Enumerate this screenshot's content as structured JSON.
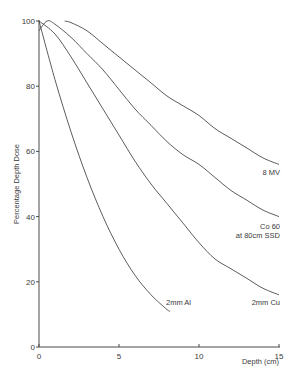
{
  "chart_data": {
    "type": "line",
    "title": "",
    "xlabel": "Depth (cm)",
    "ylabel": "Percentage Depth Dose",
    "xlim": [
      0,
      15
    ],
    "ylim": [
      0,
      100
    ],
    "x_ticks": [
      0,
      5,
      10,
      15
    ],
    "x_tick_labels": [
      "0",
      "5",
      "10",
      "15"
    ],
    "y_ticks": [
      0,
      20,
      40,
      60,
      80,
      100
    ],
    "y_tick_labels": [
      "0",
      "20",
      "40",
      "60",
      "80",
      "100"
    ],
    "grid": false,
    "legend": "inline labels at curve ends",
    "series": [
      {
        "name": "8 MV",
        "label_lines": [
          "8 MV"
        ],
        "x": [
          1.6,
          2,
          3,
          4,
          5,
          6,
          7,
          8,
          9,
          10,
          11,
          12,
          13,
          14,
          15
        ],
        "values": [
          100,
          99.5,
          97,
          93,
          89,
          85,
          81,
          77,
          74,
          71,
          67,
          64,
          61,
          58,
          56
        ]
      },
      {
        "name": "Co 60 at 80cm SSD",
        "label_lines": [
          "Co 60",
          "at  80cm SSD"
        ],
        "x": [
          0,
          0.5,
          1,
          2,
          3,
          4,
          5,
          6,
          7,
          8,
          9,
          10,
          11,
          12,
          13,
          14,
          15
        ],
        "values": [
          97,
          100,
          99,
          95,
          90,
          85,
          79,
          73,
          68,
          63,
          59,
          56,
          52,
          48,
          45,
          42,
          40
        ]
      },
      {
        "name": "2mm Cu",
        "label_lines": [
          "2mm Cu"
        ],
        "x": [
          0,
          1,
          2,
          3,
          4,
          5,
          6,
          7,
          8,
          9,
          10,
          11,
          12,
          13,
          14,
          15
        ],
        "values": [
          100,
          96,
          89,
          81,
          73,
          65,
          57,
          50,
          44,
          38,
          32,
          27,
          24,
          21,
          18,
          16
        ]
      },
      {
        "name": "2mm Al",
        "label_lines": [
          "2mm Al"
        ],
        "x": [
          0,
          1,
          2,
          3,
          4,
          5,
          6,
          7,
          8,
          8.2
        ],
        "values": [
          100,
          82,
          66,
          52,
          40,
          30,
          22,
          16,
          11.5,
          11
        ]
      }
    ],
    "colors": {
      "line": "#4a4a4a",
      "axis": "#4a4a4a",
      "text": "#3a3a3a"
    }
  }
}
